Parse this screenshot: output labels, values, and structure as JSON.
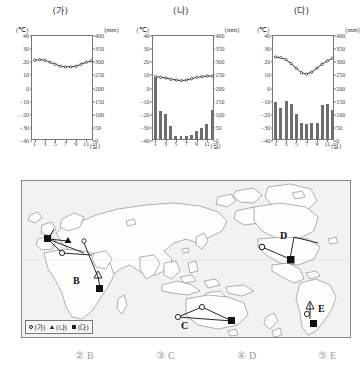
{
  "charts": [
    {
      "title": "(가)",
      "left_unit": "(℃)",
      "right_unit": "(mm)",
      "x_unit": "(월)",
      "temp_ticks": [
        "40",
        "30",
        "20",
        "10",
        "0",
        "-10",
        "-20",
        "-30",
        "-40"
      ],
      "precip_ticks": [
        "400",
        "350",
        "300",
        "250",
        "200",
        "150",
        "100",
        "50",
        "0"
      ],
      "x_ticks": [
        "1",
        "3",
        "5",
        "7",
        "9",
        "11"
      ],
      "chart_data": {
        "type": "line",
        "title": "(가)",
        "categories": [
          "1",
          "2",
          "3",
          "4",
          "5",
          "6",
          "7",
          "8",
          "9",
          "10",
          "11",
          "12"
        ],
        "xlabel": "(월)",
        "ylabel": "(℃)",
        "ylabel2": "(mm)",
        "ylim": [
          -40,
          40
        ],
        "ylim2": [
          0,
          400
        ],
        "grid": false,
        "series": [
          {
            "name": "기온",
            "unit": "℃",
            "type": "line",
            "values": [
              21.5,
              22.0,
              21.5,
              20.0,
              18.5,
              17.0,
              16.5,
              16.5,
              17.0,
              18.5,
              20.0,
              21.0
            ]
          },
          {
            "name": "강수량",
            "unit": "mm",
            "type": "bar",
            "values": [
              0,
              0,
              0,
              0,
              0,
              0,
              0,
              0,
              0,
              0,
              0,
              0
            ]
          }
        ]
      }
    },
    {
      "title": "(나)",
      "left_unit": "(℃)",
      "right_unit": "(mm)",
      "x_unit": "(월)",
      "temp_ticks": [
        "40",
        "30",
        "20",
        "10",
        "0",
        "-10",
        "-20",
        "-30",
        "-40"
      ],
      "precip_ticks": [
        "400",
        "350",
        "300",
        "250",
        "200",
        "150",
        "100",
        "50",
        "0"
      ],
      "x_ticks": [
        "1",
        "3",
        "5",
        "7",
        "9",
        "11"
      ],
      "chart_data": {
        "type": "bar",
        "title": "(나)",
        "categories": [
          "1",
          "2",
          "3",
          "4",
          "5",
          "6",
          "7",
          "8",
          "9",
          "10",
          "11",
          "12"
        ],
        "xlabel": "(월)",
        "ylabel": "(℃)",
        "ylabel2": "(mm)",
        "ylim": [
          -40,
          40
        ],
        "ylim2": [
          0,
          400
        ],
        "grid": false,
        "series": [
          {
            "name": "기온",
            "unit": "℃",
            "type": "line",
            "values": [
              9.0,
              8.5,
              8.0,
              7.0,
              6.5,
              6.0,
              6.5,
              7.5,
              8.5,
              9.0,
              9.5,
              9.5
            ]
          },
          {
            "name": "강수량",
            "unit": "mm",
            "type": "bar",
            "values": [
              235,
              105,
              95,
              48,
              12,
              10,
              10,
              16,
              32,
              42,
              57,
              112
            ]
          }
        ]
      }
    },
    {
      "title": "(다)",
      "left_unit": "(℃)",
      "right_unit": "(mm)",
      "x_unit": "(월)",
      "temp_ticks": [
        "40",
        "30",
        "20",
        "10",
        "0",
        "-10",
        "-20",
        "-30",
        "-40"
      ],
      "precip_ticks": [
        "400",
        "350",
        "300",
        "250",
        "200",
        "150",
        "100",
        "50",
        "0"
      ],
      "x_ticks": [
        "1",
        "3",
        "5",
        "7",
        "9",
        "11"
      ],
      "chart_data": {
        "type": "bar",
        "title": "(다)",
        "categories": [
          "1",
          "2",
          "3",
          "4",
          "5",
          "6",
          "7",
          "8",
          "9",
          "10",
          "11",
          "12"
        ],
        "xlabel": "(월)",
        "ylabel": "(℃)",
        "ylabel2": "(mm)",
        "ylim": [
          -40,
          40
        ],
        "ylim2": [
          0,
          400
        ],
        "grid": false,
        "series": [
          {
            "name": "기온",
            "unit": "℃",
            "type": "line",
            "values": [
              24.0,
              23.5,
              22.0,
              19.0,
              15.5,
              12.0,
              11.0,
              12.5,
              15.5,
              18.5,
              21.0,
              23.0
            ]
          },
          {
            "name": "강수량",
            "unit": "mm",
            "type": "bar",
            "values": [
              140,
              118,
              145,
              135,
              96,
              60,
              56,
              62,
              60,
              130,
              132,
              110
            ]
          }
        ]
      }
    }
  ],
  "map": {
    "labels": [
      {
        "id": "B",
        "text": "B"
      },
      {
        "id": "C",
        "text": "C"
      },
      {
        "id": "D",
        "text": "D"
      },
      {
        "id": "E",
        "text": "E"
      }
    ],
    "legend": [
      {
        "marker": "circle",
        "label": "(가)"
      },
      {
        "marker": "triangle",
        "label": "(나)"
      },
      {
        "marker": "square",
        "label": "(다)"
      }
    ]
  },
  "answers": [
    {
      "num": "②",
      "label": "B"
    },
    {
      "num": "③",
      "label": "C"
    },
    {
      "num": "④",
      "label": "D"
    },
    {
      "num": "⑤",
      "label": "E"
    }
  ]
}
